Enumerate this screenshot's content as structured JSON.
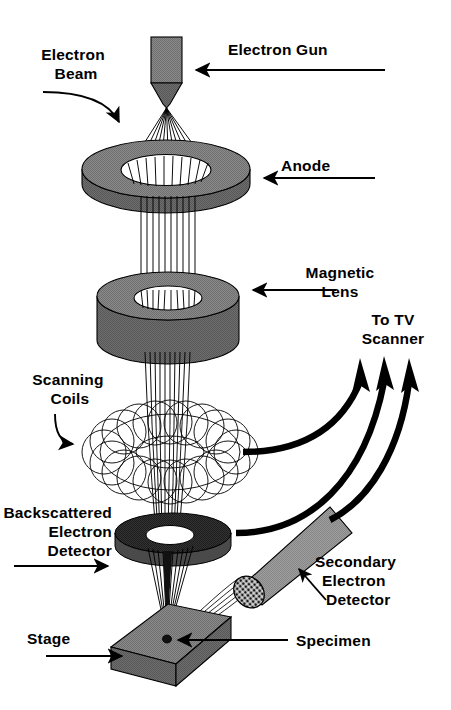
{
  "diagram": {
    "background_color": "#ffffff",
    "ink_color": "#000000",
    "fills": {
      "body_gray": "#808080",
      "body_gray_light": "#9a9a9a",
      "body_gray_dark": "#6b6b6b",
      "detector_dark": "#2b2b2b",
      "detector_dark_edge": "#4a4a4a",
      "hole_white": "#ffffff"
    },
    "labels": [
      {
        "id": "electron-beam",
        "lines": [
          "Electron",
          "Beam"
        ],
        "align": "center"
      },
      {
        "id": "electron-gun",
        "lines": [
          "Electron Gun"
        ],
        "align": "start"
      },
      {
        "id": "anode",
        "lines": [
          "Anode"
        ],
        "align": "start"
      },
      {
        "id": "magnetic-lens",
        "lines": [
          "Magnetic",
          "Lens"
        ],
        "align": "center"
      },
      {
        "id": "to-tv-scanner",
        "lines": [
          "To TV",
          "Scanner"
        ],
        "align": "center"
      },
      {
        "id": "scanning-coils",
        "lines": [
          "Scanning",
          "Coils"
        ],
        "align": "center"
      },
      {
        "id": "backscattered",
        "lines": [
          "Backscattered",
          "Electron",
          "Detector"
        ],
        "align": "end"
      },
      {
        "id": "secondary",
        "lines": [
          "Secondary",
          "Electron",
          "Detector"
        ],
        "align": "start"
      },
      {
        "id": "stage",
        "lines": [
          "Stage"
        ],
        "align": "start"
      },
      {
        "id": "specimen",
        "lines": [
          "Specimen"
        ],
        "align": "start"
      }
    ],
    "label_text": {
      "electron_beam_1": "Electron",
      "electron_beam_2": "Beam",
      "electron_gun": "Electron Gun",
      "anode": "Anode",
      "magnetic_lens_1": "Magnetic",
      "magnetic_lens_2": "Lens",
      "to_tv_1": "To TV",
      "to_tv_2": "Scanner",
      "scanning_coils_1": "Scanning",
      "scanning_coils_2": "Coils",
      "backscattered_1": "Backscattered",
      "backscattered_2": "Electron",
      "backscattered_3": "Detector",
      "secondary_1": "Secondary",
      "secondary_2": "Electron",
      "secondary_3": "Detector",
      "stage": "Stage",
      "specimen": "Specimen"
    },
    "components": [
      {
        "id": "electron-gun-body",
        "name": "Electron gun column"
      },
      {
        "id": "electron-gun-cone",
        "name": "Electron gun tapered tip"
      },
      {
        "id": "anode-disc",
        "name": "Anode disc with aperture"
      },
      {
        "id": "magnetic-lens-cylinder",
        "name": "Magnetic lens cylinder with bore"
      },
      {
        "id": "scanning-coils-torus",
        "name": "Scanning coils toroid winding"
      },
      {
        "id": "backscatter-detector-disc",
        "name": "Backscattered electron detector annulus"
      },
      {
        "id": "secondary-detector-bar",
        "name": "Secondary electron detector probe"
      },
      {
        "id": "specimen-stage",
        "name": "Specimen stage slab"
      },
      {
        "id": "specimen-dot",
        "name": "Specimen on stage"
      },
      {
        "id": "electron-beam-rays",
        "name": "Electron beam ray bundle"
      },
      {
        "id": "signal-arrows",
        "name": "Signal arrows to TV scanner"
      }
    ]
  }
}
